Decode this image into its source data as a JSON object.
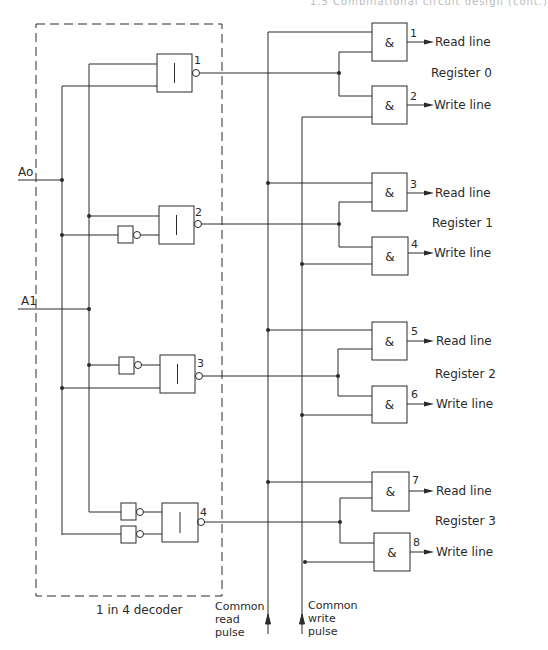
{
  "header": {
    "text": "1.5  Combinational circuit design (cont.)"
  },
  "decoder": {
    "label": "1 in 4 decoder",
    "inputs": [
      {
        "name": "A0",
        "label": "Ao"
      },
      {
        "name": "A1",
        "label": "A1"
      }
    ],
    "gates": [
      {
        "number": "1",
        "symbol": "|"
      },
      {
        "number": "2",
        "symbol": "|"
      },
      {
        "number": "3",
        "symbol": "|"
      },
      {
        "number": "4",
        "symbol": "|"
      }
    ]
  },
  "registers": [
    {
      "label": "Register 0",
      "read_gate": "1",
      "write_gate": "2",
      "read_label": "Read line",
      "write_label": "Write line",
      "gate_symbol": "&"
    },
    {
      "label": "Register 1",
      "read_gate": "3",
      "write_gate": "4",
      "read_label": "Read line",
      "write_label": "Write line",
      "gate_symbol": "&"
    },
    {
      "label": "Register 2",
      "read_gate": "5",
      "write_gate": "6",
      "read_label": "Read line",
      "write_label": "Write line",
      "gate_symbol": "&"
    },
    {
      "label": "Register 3",
      "read_gate": "7",
      "write_gate": "8",
      "read_label": "Read line",
      "write_label": "Write line",
      "gate_symbol": "&"
    }
  ],
  "pulses": {
    "read": [
      "Common",
      "read",
      "pulse"
    ],
    "write": [
      "Common",
      "write",
      "pulse"
    ]
  }
}
